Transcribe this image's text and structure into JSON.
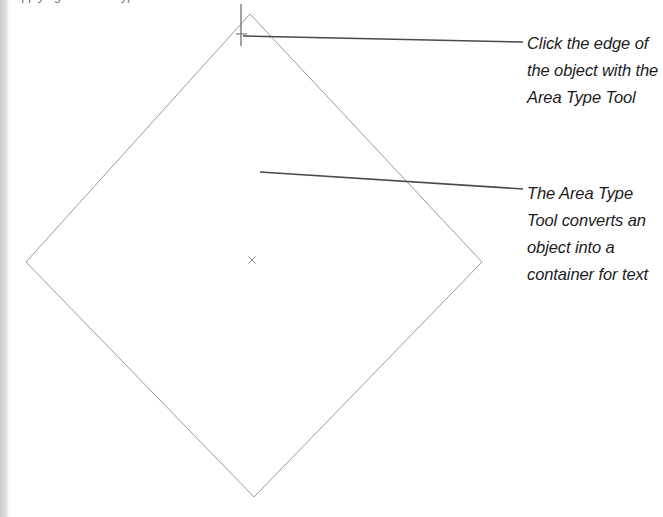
{
  "page": {
    "width": 663,
    "height": 517,
    "background_color": "#ffffff",
    "gutter_color": "#d6d6d6"
  },
  "caption": {
    "heading_text": "Applying the Area Type Tool"
  },
  "artwork": {
    "shape_name": "diamond-path",
    "stroke_color": "#9a9a9a",
    "stroke_width": 1,
    "fill": "none",
    "vertices": {
      "top": [
        250,
        14
      ],
      "right": [
        482,
        262
      ],
      "bottom": [
        254,
        497
      ],
      "left": [
        26,
        262
      ]
    },
    "center_mark": {
      "name": "center-point-marker",
      "glyph": "×",
      "x": 252,
      "y": 260,
      "color": "#8d8d8d"
    },
    "text_cursor": {
      "name": "area-type-cursor",
      "x": 241,
      "y_top": 4,
      "y_bottom": 46,
      "color": "#6f6f6f"
    }
  },
  "leaders": {
    "stroke_color": "#4a4a4a",
    "stroke_width": 1.6,
    "items": [
      {
        "name": "leader-line-click-edge",
        "x1": 243,
        "y1": 36,
        "x2": 523,
        "y2": 42
      },
      {
        "name": "leader-line-converts",
        "x1": 260,
        "y1": 172,
        "x2": 523,
        "y2": 189
      }
    ]
  },
  "annotations": {
    "click_edge": {
      "name": "annotation-click-edge",
      "lines": [
        "Click the edge of",
        "the object with the",
        "Area Type Tool"
      ]
    },
    "converts": {
      "name": "annotation-converts",
      "lines": [
        "The Area Type",
        "Tool converts an",
        "object into a",
        "container for text"
      ]
    }
  }
}
